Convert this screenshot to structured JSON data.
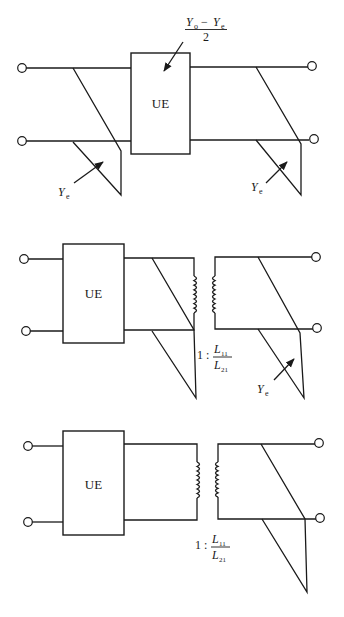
{
  "figure": {
    "type": "circuit-equivalence-diagram",
    "stroke_color": "#1a1a1a",
    "background": "#ffffff"
  },
  "circuit1": {
    "ue_label": "UE",
    "ue_admittance_label": {
      "numerator_a": "Y",
      "numerator_a_sub": "o",
      "minus": "−",
      "numerator_b": "Y",
      "numerator_b_sub": "e",
      "denominator": "2"
    },
    "left_stub_label": {
      "symbol": "Y",
      "sub": "e"
    },
    "right_stub_label": {
      "symbol": "Y",
      "sub": "e"
    }
  },
  "circuit2": {
    "ue_label": "UE",
    "transformer_ratio": {
      "prefix": "1 :",
      "num": "L",
      "num_sub": "11",
      "den": "L",
      "den_sub": "21"
    },
    "stub_label": {
      "symbol": "Y",
      "sub": "e"
    }
  },
  "circuit3": {
    "ue_label": "UE",
    "transformer_ratio": {
      "prefix": "1 :",
      "num": "L",
      "num_sub": "11",
      "den": "L",
      "den_sub": "21"
    }
  }
}
